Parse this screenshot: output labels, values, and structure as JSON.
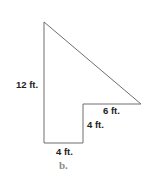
{
  "figure": {
    "caption": "b.",
    "shape": "l-shaped-triangle-composite",
    "stroke_color": "#6e6e6e",
    "label_color": "#222222",
    "caption_color": "#8a8a8a",
    "vertices": [
      [
        44,
        22
      ],
      [
        141,
        104
      ],
      [
        83,
        104
      ],
      [
        83,
        143
      ],
      [
        44,
        143
      ]
    ],
    "labels": {
      "left_side": "12 ft.",
      "top_notch": "6 ft.",
      "notch_vertical": "4 ft.",
      "bottom": "4 ft."
    }
  }
}
